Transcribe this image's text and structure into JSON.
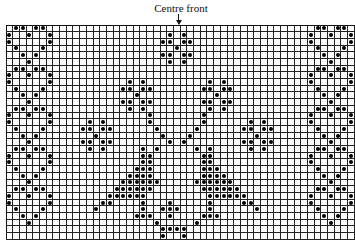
{
  "label": "Centre front",
  "grid": {
    "cols": 52,
    "rows": 32,
    "cell": 6.7,
    "color": "#222222",
    "dot_color": "#000000"
  },
  "dots": [
    [
      0,
      1
    ],
    [
      0,
      2
    ],
    [
      0,
      4
    ],
    [
      0,
      5
    ],
    [
      1,
      0
    ],
    [
      1,
      3
    ],
    [
      1,
      6
    ],
    [
      2,
      0
    ],
    [
      2,
      6
    ],
    [
      3,
      1
    ],
    [
      3,
      5
    ],
    [
      4,
      2
    ],
    [
      4,
      4
    ],
    [
      5,
      3
    ],
    [
      6,
      1
    ],
    [
      6,
      2
    ],
    [
      6,
      4
    ],
    [
      6,
      5
    ],
    [
      7,
      0
    ],
    [
      7,
      3
    ],
    [
      7,
      6
    ],
    [
      8,
      0
    ],
    [
      8,
      6
    ],
    [
      9,
      1
    ],
    [
      9,
      5
    ],
    [
      10,
      2
    ],
    [
      10,
      4
    ],
    [
      11,
      3
    ],
    [
      12,
      1
    ],
    [
      12,
      2
    ],
    [
      12,
      4
    ],
    [
      12,
      5
    ],
    [
      13,
      0
    ],
    [
      13,
      3
    ],
    [
      13,
      6
    ],
    [
      14,
      0
    ],
    [
      14,
      6
    ],
    [
      15,
      1
    ],
    [
      15,
      5
    ],
    [
      16,
      2
    ],
    [
      16,
      4
    ],
    [
      17,
      3
    ],
    [
      18,
      1
    ],
    [
      18,
      2
    ],
    [
      18,
      4
    ],
    [
      18,
      5
    ],
    [
      19,
      0
    ],
    [
      19,
      3
    ],
    [
      19,
      6
    ],
    [
      20,
      0
    ],
    [
      20,
      6
    ],
    [
      21,
      1
    ],
    [
      21,
      5
    ],
    [
      22,
      2
    ],
    [
      22,
      4
    ],
    [
      23,
      3
    ],
    [
      24,
      1
    ],
    [
      24,
      2
    ],
    [
      24,
      4
    ],
    [
      24,
      5
    ],
    [
      25,
      0
    ],
    [
      25,
      3
    ],
    [
      25,
      6
    ],
    [
      26,
      0
    ],
    [
      26,
      6
    ],
    [
      27,
      1
    ],
    [
      27,
      5
    ],
    [
      28,
      2
    ],
    [
      28,
      4
    ],
    [
      29,
      3
    ],
    [
      0,
      46
    ],
    [
      0,
      47
    ],
    [
      0,
      49
    ],
    [
      0,
      50
    ],
    [
      1,
      45
    ],
    [
      1,
      48
    ],
    [
      1,
      51
    ],
    [
      2,
      45
    ],
    [
      2,
      51
    ],
    [
      3,
      46
    ],
    [
      3,
      50
    ],
    [
      4,
      47
    ],
    [
      4,
      49
    ],
    [
      5,
      48
    ],
    [
      6,
      46
    ],
    [
      6,
      47
    ],
    [
      6,
      49
    ],
    [
      6,
      50
    ],
    [
      7,
      45
    ],
    [
      7,
      48
    ],
    [
      7,
      51
    ],
    [
      8,
      45
    ],
    [
      8,
      51
    ],
    [
      9,
      46
    ],
    [
      9,
      50
    ],
    [
      10,
      47
    ],
    [
      10,
      49
    ],
    [
      11,
      48
    ],
    [
      12,
      46
    ],
    [
      12,
      47
    ],
    [
      12,
      49
    ],
    [
      12,
      50
    ],
    [
      13,
      45
    ],
    [
      13,
      48
    ],
    [
      13,
      51
    ],
    [
      14,
      45
    ],
    [
      14,
      51
    ],
    [
      15,
      46
    ],
    [
      15,
      50
    ],
    [
      16,
      47
    ],
    [
      16,
      49
    ],
    [
      17,
      48
    ],
    [
      18,
      46
    ],
    [
      18,
      47
    ],
    [
      18,
      49
    ],
    [
      18,
      50
    ],
    [
      19,
      45
    ],
    [
      19,
      48
    ],
    [
      19,
      51
    ],
    [
      20,
      45
    ],
    [
      20,
      51
    ],
    [
      21,
      46
    ],
    [
      21,
      50
    ],
    [
      22,
      47
    ],
    [
      22,
      49
    ],
    [
      23,
      48
    ],
    [
      24,
      46
    ],
    [
      24,
      47
    ],
    [
      24,
      49
    ],
    [
      24,
      50
    ],
    [
      25,
      45
    ],
    [
      25,
      48
    ],
    [
      25,
      51
    ],
    [
      26,
      45
    ],
    [
      26,
      51
    ],
    [
      27,
      46
    ],
    [
      27,
      50
    ],
    [
      28,
      47
    ],
    [
      28,
      49
    ],
    [
      29,
      48
    ],
    [
      1,
      24
    ],
    [
      1,
      26
    ],
    [
      2,
      23
    ],
    [
      2,
      24
    ],
    [
      2,
      26
    ],
    [
      2,
      27
    ],
    [
      3,
      25
    ],
    [
      4,
      23
    ],
    [
      4,
      24
    ],
    [
      4,
      26
    ],
    [
      4,
      27
    ],
    [
      5,
      24
    ],
    [
      5,
      26
    ],
    [
      8,
      18
    ],
    [
      8,
      20
    ],
    [
      9,
      17
    ],
    [
      9,
      18
    ],
    [
      9,
      20
    ],
    [
      9,
      21
    ],
    [
      10,
      19
    ],
    [
      11,
      17
    ],
    [
      11,
      18
    ],
    [
      11,
      20
    ],
    [
      11,
      21
    ],
    [
      12,
      18
    ],
    [
      12,
      20
    ],
    [
      8,
      30
    ],
    [
      8,
      32
    ],
    [
      9,
      29
    ],
    [
      9,
      30
    ],
    [
      9,
      32
    ],
    [
      9,
      33
    ],
    [
      10,
      31
    ],
    [
      11,
      29
    ],
    [
      11,
      30
    ],
    [
      11,
      32
    ],
    [
      11,
      33
    ],
    [
      12,
      30
    ],
    [
      12,
      32
    ],
    [
      14,
      12
    ],
    [
      14,
      14
    ],
    [
      15,
      11
    ],
    [
      15,
      12
    ],
    [
      15,
      14
    ],
    [
      15,
      15
    ],
    [
      16,
      13
    ],
    [
      17,
      11
    ],
    [
      17,
      12
    ],
    [
      17,
      14
    ],
    [
      17,
      15
    ],
    [
      18,
      12
    ],
    [
      18,
      14
    ],
    [
      14,
      36
    ],
    [
      14,
      38
    ],
    [
      15,
      35
    ],
    [
      15,
      36
    ],
    [
      15,
      38
    ],
    [
      15,
      39
    ],
    [
      16,
      37
    ],
    [
      17,
      35
    ],
    [
      17,
      36
    ],
    [
      17,
      38
    ],
    [
      17,
      39
    ],
    [
      18,
      36
    ],
    [
      18,
      38
    ],
    [
      13,
      21
    ],
    [
      13,
      29
    ],
    [
      14,
      21
    ],
    [
      14,
      29
    ],
    [
      15,
      22
    ],
    [
      15,
      28
    ],
    [
      16,
      23
    ],
    [
      16,
      27
    ],
    [
      17,
      24
    ],
    [
      17,
      26
    ],
    [
      18,
      20
    ],
    [
      18,
      22
    ],
    [
      18,
      28
    ],
    [
      18,
      30
    ],
    [
      19,
      20
    ],
    [
      19,
      21
    ],
    [
      19,
      29
    ],
    [
      19,
      30
    ],
    [
      20,
      20
    ],
    [
      20,
      21
    ],
    [
      20,
      29
    ],
    [
      20,
      30
    ],
    [
      21,
      19
    ],
    [
      21,
      20
    ],
    [
      21,
      21
    ],
    [
      21,
      29
    ],
    [
      21,
      30
    ],
    [
      21,
      31
    ],
    [
      22,
      18
    ],
    [
      22,
      19
    ],
    [
      22,
      20
    ],
    [
      22,
      21
    ],
    [
      22,
      29
    ],
    [
      22,
      30
    ],
    [
      22,
      31
    ],
    [
      22,
      32
    ],
    [
      23,
      17
    ],
    [
      23,
      18
    ],
    [
      23,
      19
    ],
    [
      23,
      20
    ],
    [
      23,
      21
    ],
    [
      23,
      22
    ],
    [
      23,
      28
    ],
    [
      23,
      29
    ],
    [
      23,
      30
    ],
    [
      23,
      31
    ],
    [
      23,
      32
    ],
    [
      23,
      33
    ],
    [
      24,
      16
    ],
    [
      24,
      17
    ],
    [
      24,
      18
    ],
    [
      24,
      19
    ],
    [
      24,
      20
    ],
    [
      24,
      21
    ],
    [
      24,
      29
    ],
    [
      24,
      30
    ],
    [
      24,
      31
    ],
    [
      24,
      32
    ],
    [
      24,
      33
    ],
    [
      24,
      34
    ],
    [
      25,
      15
    ],
    [
      25,
      16
    ],
    [
      25,
      17
    ],
    [
      25,
      18
    ],
    [
      25,
      19
    ],
    [
      25,
      20
    ],
    [
      25,
      30
    ],
    [
      25,
      31
    ],
    [
      25,
      32
    ],
    [
      25,
      33
    ],
    [
      25,
      34
    ],
    [
      25,
      35
    ],
    [
      26,
      14
    ],
    [
      26,
      15
    ],
    [
      26,
      20
    ],
    [
      26,
      24
    ],
    [
      26,
      30
    ],
    [
      26,
      35
    ],
    [
      26,
      36
    ],
    [
      27,
      13
    ],
    [
      27,
      20
    ],
    [
      27,
      23
    ],
    [
      27,
      24
    ],
    [
      27,
      25
    ],
    [
      27,
      30
    ],
    [
      27,
      37
    ],
    [
      28,
      19
    ],
    [
      28,
      20
    ],
    [
      28,
      21
    ],
    [
      28,
      24
    ],
    [
      28,
      29
    ],
    [
      28,
      30
    ],
    [
      28,
      31
    ],
    [
      29,
      22
    ],
    [
      29,
      28
    ],
    [
      30,
      23
    ],
    [
      30,
      24
    ],
    [
      30,
      25
    ],
    [
      30,
      26
    ],
    [
      31,
      23
    ],
    [
      31,
      26
    ],
    [
      32,
      20
    ],
    [
      32,
      21
    ],
    [
      32,
      22
    ],
    [
      32,
      23
    ],
    [
      32,
      24
    ],
    [
      32,
      25
    ],
    [
      32,
      26
    ],
    [
      32,
      27
    ],
    [
      32,
      28
    ],
    [
      32,
      29
    ],
    [
      32,
      30
    ]
  ]
}
